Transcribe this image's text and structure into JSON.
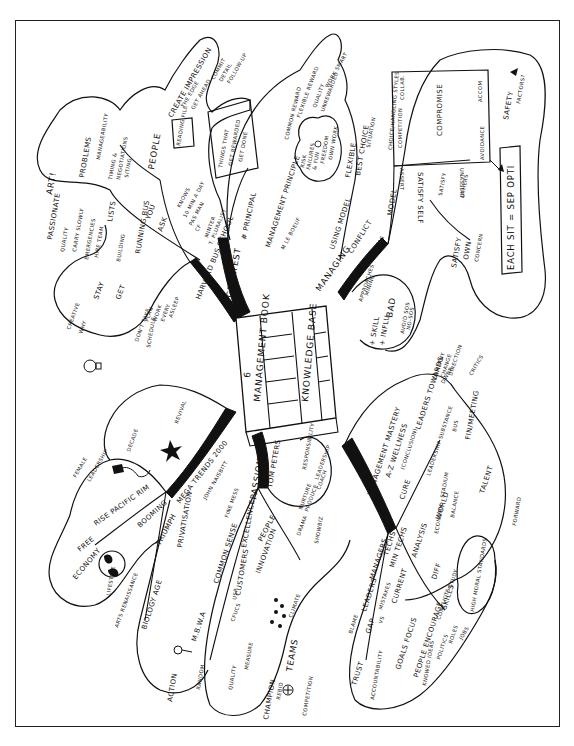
{
  "document": {
    "type": "hand-drawn mind map",
    "orientation": "rotated 90 degrees counter-clockwise",
    "colors": {
      "ink": "#111111",
      "paper": "#ffffff"
    }
  },
  "center": {
    "title_1": "MANAGEMENT BOOK",
    "marker": "6",
    "title_2": "KNOWLEDGE BASE"
  },
  "branches": {
    "greatest": {
      "main": "GREATEST",
      "sub": "HARVARD BUS SCHOOL",
      "sub2": "T. PLURALIST",
      "people": "PEOPLE",
      "you": "YOU",
      "ask": "ASK",
      "items": [
        "KNOWS",
        "10 MIN A DAY",
        "PAS MAN",
        "CF",
        "MINTER"
      ],
      "create_impression": "CREATE IMPRESSION",
      "the_edge": "THE EDGE",
      "get_ahead": "GET AHEAD",
      "bullets": [
        "COMMIT",
        "DETAIL",
        "FOLLOW-UP"
      ],
      "reading_file": "READING FILE",
      "problems": "PROBLEMS",
      "manageability": "MANAGEABILITY",
      "timing": "TIMING &",
      "negotiations": "NEGOTIATIONS",
      "siting": "SITING",
      "lists": "LISTS",
      "running_bus": "RUNNING BUS",
      "building": "BUILDING",
      "passionate": "PASSIONATE",
      "art": "ART!",
      "quality": "QUALITY",
      "carry_slowly": "CARRY SLOWLY",
      "emergencies": "EMERGENCIES",
      "hire_team": "HIRE TEAM",
      "stay": "STAY",
      "get": "GET",
      "creative": "CREATIVE",
      "why": "WHY",
      "dont_take": "DON'T TAKE",
      "plan": "PLAN",
      "work": "WORK",
      "every": "EVERY",
      "asleep": "ASLEEP",
      "schedule": "SCHEDULE"
    },
    "principal": {
      "things_box": [
        "THINGS THAT",
        "GET REWARDED",
        "GET DONE"
      ],
      "principal": "# PRINCIPAL",
      "management_principle": "MANAGEMENT PRINCIPLE",
      "m_le_boeuf": "M LE BOEUF",
      "common_reward": "COMMON REWARD",
      "flexible_reward": "FLEXIBLE REWARD",
      "quality": "QUALITY",
      "unrewarded": "UNREWARDED",
      "work_smart": "WORK SMART",
      "rewards": [
        "RISK",
        "FAILURES",
        "& FUN",
        "FREEDOM",
        "OWN WORK"
      ]
    },
    "managing": {
      "main": "MANAGING",
      "using_model": "USING MODEL",
      "flexible": "FLEXIBLE",
      "best_choice": "BEST CHOICE",
      "situation": "SITUATION",
      "conflict": "CONFLICT",
      "model": "MODEL",
      "ken_thomas": "KEN THOMAS",
      "choice_handling": "CHOICE/HANDLING STYLES",
      "box": {
        "competition": "COMPETITION",
        "collaborate": "COLLAB.",
        "compromise": "COMPROMISE",
        "accommodate": "ACCOM",
        "avoidance": "AVOIDANCE",
        "assert": "ASSERT",
        "unassert": "UNASSERT"
      },
      "satisfy_self": "SATISFY SELF",
      "satisfy": "SATISFY",
      "own": "OWN",
      "concern": "CONCERN",
      "satisfy_others": "OTHERS",
      "safety_rules": "SAFETY",
      "factors": "FACTORS?",
      "each_sit": "EACH SIT = SEP OPTI",
      "approaches": "APPROACHES",
      "skill_mining": "MINING",
      "skill": "+ SKILL",
      "influ": "+ INFLU",
      "bad": "BAD",
      "avoid_sos": "AVOID SOS",
      "no_sos": "NO-SOS"
    },
    "mastery": {
      "main": "MANAGEMENT MASTERY",
      "a_z": "A-Z WELLNESS",
      "conclusion": "(CONCLUSION)",
      "cure": "CURE",
      "leaders_towards": "LEADERS TOWARDS",
      "company": "COMPANY",
      "change": "CHANGE",
      "direction": "DIRECTION",
      "critics": "CRITICS",
      "dwnr": "DWNR",
      "leadership_substance": "LEADERSHIP SUBSTANCE",
      "fin_meeting": "FIN/MEETING",
      "bus": "BUS",
      "talent": "TALENT",
      "forward": "FORWARD",
      "world": "WORLD",
      "stadium": "STADIUM",
      "balance": "BALANCE",
      "economy": "ECONOMY",
      "managers": "MANAGERS",
      "leaders": "LEADERS",
      "blame": "BLAME",
      "gap": "GAP",
      "vs": "VS",
      "mistakes": "MISTAKES",
      "trust": "TRUST",
      "accountability": "ACCOUNTABILITY",
      "techs": "TECHS",
      "min_techs": "MIN TECHS",
      "current": "CURRENT",
      "goals_focus": "GOALS FOCUS",
      "people_encourage": "PEOPLE ENCOURAGE",
      "knowed_ideas": "KNOWED IDEAS",
      "politics": "POLITICS",
      "conflicts": "CONFLICTS",
      "roles": "ROLES",
      "jobs": "JOBS",
      "analysis": "ANALYSIS",
      "diff": "DIFF",
      "skills": "SKILLS",
      "study": "STUDY",
      "high_moral": "HIGH MORAL STANDARDS"
    },
    "passion": {
      "main": "PASSION",
      "tom_peters": "TOM PETERS",
      "people": "PEOPLE",
      "responsibility": "RESPONSIBILITY",
      "leadership": "LEADERSHIP",
      "coach": "COACH",
      "nurture": "NURTURE",
      "produce": "PRODUCE",
      "drama": "DRAMA",
      "showbiz": "SHOWBIZ",
      "excellence": "EXCELLENCE",
      "innovation": "INNOVATION",
      "customers": "CUSTOMERS",
      "climate": "CLIMATE",
      "cfucs": "CFUCS",
      "teams": "TEAMS",
      "measure": "MEASURE",
      "quality": "QUALITY",
      "usp": "USP",
      "champion": "CHAMPION",
      "rebid": "REBID",
      "competition": "COMPETITION",
      "fine_mess": "FINE MESS",
      "common_sense": "COMMON SENSE",
      "mbwa": "M.B.W.A",
      "random": "RANDOM",
      "action": "ACTION"
    },
    "megatrends": {
      "main": "MEGA TRENDS 2000",
      "john_naisbitt": "JOHN NAISBITT",
      "revival": "REVIVAL",
      "female": "FEMALE",
      "leadership": "LEADERSHIP",
      "decade": "DECADE",
      "rise_pacific_rim": "RISE PACIFIC RIM",
      "booming": "BOOMING",
      "free": "FREE",
      "economy": "ECONOMY",
      "lifestyle": "LIFESTYLE",
      "arts_renaissance": "ARTS RENAISSANCE",
      "triumph": "TRIUMPH",
      "privatisation": "PRIVATISATION",
      "biology_age": "BIOLOGY AGE"
    }
  }
}
